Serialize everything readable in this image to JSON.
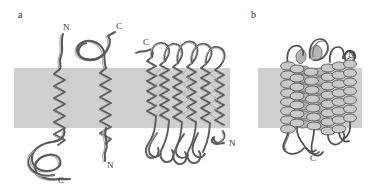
{
  "figure": {
    "width": 378,
    "height": 193,
    "background_color": "#ffffff",
    "membrane_color": "#cfcfcf",
    "ribbon_dark_color": "#5a5a5a",
    "ribbon_light_color": "#a8a8a8",
    "caption_visible": false
  },
  "panels": [
    {
      "id": "a",
      "letter": "a",
      "letter_x": 18,
      "letter_y": 18,
      "description": "Transmembrane alpha-helices and a beta-barrel spanning the lipid bilayer",
      "membrane": {
        "x": 14,
        "y": 68,
        "width": 216,
        "height": 60
      },
      "structures": [
        {
          "name": "single-pass-helix-left",
          "type": "alpha-helix",
          "n_terminus_side": "top",
          "c_terminus_side": "bottom"
        },
        {
          "name": "single-pass-helix-middle",
          "type": "alpha-helix",
          "n_terminus_side": "bottom",
          "c_terminus_side": "top"
        },
        {
          "name": "beta-barrel",
          "type": "beta-barrel",
          "strand_count": 8,
          "n_terminus_side": "bottom-right",
          "c_terminus_side": "top-left"
        }
      ],
      "labels": [
        {
          "text": "N",
          "x": 63,
          "y": 30,
          "structure": "single-pass-helix-left"
        },
        {
          "text": "C",
          "x": 116,
          "y": 29,
          "structure": "single-pass-helix-middle"
        },
        {
          "text": "C",
          "x": 143,
          "y": 45,
          "structure": "beta-barrel"
        },
        {
          "text": "C",
          "x": 58,
          "y": 183,
          "structure": "single-pass-helix-left"
        },
        {
          "text": "N",
          "x": 107,
          "y": 168,
          "structure": "single-pass-helix-middle"
        },
        {
          "text": "N",
          "x": 229,
          "y": 146,
          "structure": "beta-barrel"
        }
      ]
    },
    {
      "id": "b",
      "letter": "b",
      "letter_x": 251,
      "letter_y": 18,
      "description": "Polytopic alpha-helical bundle membrane protein",
      "membrane": {
        "x": 258,
        "y": 68,
        "width": 104,
        "height": 60
      },
      "structures": [
        {
          "name": "helix-bundle",
          "type": "alpha-helical-bundle",
          "helix_count": 7,
          "n_terminus_side": "top-right",
          "c_terminus_side": "bottom"
        }
      ],
      "labels": [
        {
          "text": "N",
          "x": 348,
          "y": 57,
          "structure": "helix-bundle"
        },
        {
          "text": "C",
          "x": 310,
          "y": 161,
          "structure": "helix-bundle"
        }
      ]
    }
  ]
}
